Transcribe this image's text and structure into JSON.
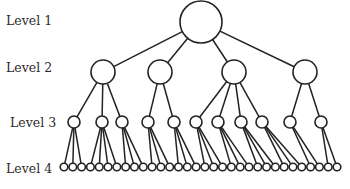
{
  "diagram": {
    "type": "tree-hierarchy",
    "level_labels": [
      "Level 1",
      "Level 2",
      "Level 3",
      "Level 4"
    ],
    "levels": [
      {
        "label": "Level 1",
        "y": 22,
        "r": 21,
        "nodes": [
          201
        ]
      },
      {
        "label": "Level 2",
        "y": 72,
        "r": 12,
        "nodes": [
          103,
          160,
          234,
          305
        ]
      },
      {
        "label": "Level 3",
        "y": 122,
        "r": 6,
        "nodes": [
          74,
          102,
          122,
          148,
          174,
          196,
          218,
          241,
          262,
          290,
          321
        ]
      },
      {
        "label": "Level 4",
        "y": 167,
        "r": 3.8,
        "count": 32,
        "x_start": 64,
        "x_end": 337
      }
    ],
    "edges_l1_l2": [
      [
        0,
        0
      ],
      [
        0,
        1
      ],
      [
        0,
        2
      ],
      [
        0,
        3
      ]
    ],
    "children_l2_to_l3": [
      [
        0,
        1,
        2
      ],
      [
        3,
        4
      ],
      [
        5,
        6,
        7,
        8
      ],
      [
        9,
        10
      ]
    ],
    "children_l3_to_l4": [
      [
        0,
        1,
        2
      ],
      [
        3,
        4,
        5,
        6
      ],
      [
        7,
        8,
        9
      ],
      [
        10,
        11,
        12
      ],
      [
        13,
        14,
        15
      ],
      [
        16,
        17,
        18
      ],
      [
        19,
        20,
        21
      ],
      [
        22,
        23,
        24
      ],
      [
        25,
        26,
        27
      ],
      [
        28,
        29
      ],
      [
        30,
        31
      ]
    ],
    "line_color": "#222222",
    "node_fill": "#ffffff"
  }
}
